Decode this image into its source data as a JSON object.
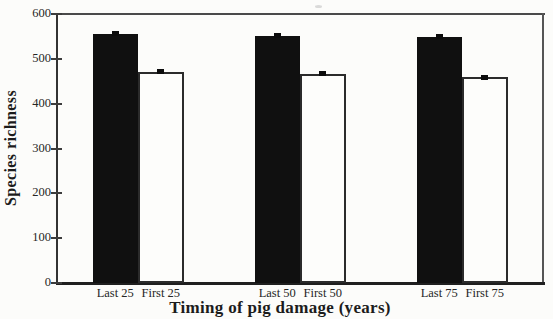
{
  "chart_data": {
    "type": "bar",
    "title": "",
    "xlabel": "Timing of pig damage (years)",
    "ylabel": "Species richness",
    "ylim": [
      0,
      600
    ],
    "yticks": [
      0,
      100,
      200,
      300,
      400,
      500,
      600
    ],
    "grid": false,
    "legend": "none",
    "groups": [
      {
        "bars": [
          {
            "label": "Last 25",
            "value": 556,
            "error": 5,
            "fill": "black"
          },
          {
            "label": "First 25",
            "value": 471,
            "error": 5,
            "fill": "white"
          }
        ]
      },
      {
        "bars": [
          {
            "label": "Last 50",
            "value": 551,
            "error": 5,
            "fill": "black"
          },
          {
            "label": "First 50",
            "value": 467,
            "error": 5,
            "fill": "white"
          }
        ]
      },
      {
        "bars": [
          {
            "label": "Last 75",
            "value": 549,
            "error": 5,
            "fill": "black"
          },
          {
            "label": "First 75",
            "value": 459,
            "error": 5,
            "fill": "white"
          }
        ]
      }
    ]
  },
  "colors": {
    "bar_dark": "#101010",
    "bar_light": "#fdfdfb",
    "axis": "#3c3c3c",
    "text": "#262626",
    "background": "#fcfcfa"
  }
}
